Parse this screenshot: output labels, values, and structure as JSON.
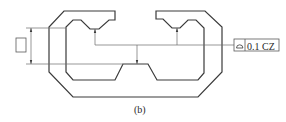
{
  "figure": {
    "caption": "(b)",
    "tolerance_frame": {
      "symbol_name": "profile-of-a-surface",
      "symbol_glyph": "⌓",
      "value": "0.1 CZ"
    },
    "datum_box_label": "",
    "colors": {
      "line": "#3a3a3a",
      "thin_line": "#6a6a6a",
      "background": "#ffffff"
    }
  }
}
